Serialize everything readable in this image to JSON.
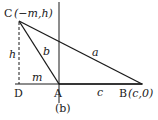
{
  "diagram": {
    "caption": "(b)",
    "points": {
      "C": {
        "label": "C",
        "coords": "(−m,h)",
        "x": 19,
        "y": 21
      },
      "D": {
        "label": "D",
        "x": 19,
        "y": 84
      },
      "A": {
        "label": "A",
        "x": 59,
        "y": 84
      },
      "B": {
        "label": "B",
        "coords": "(c,0)",
        "x": 142,
        "y": 84
      }
    },
    "segments": {
      "a": "a",
      "b": "b",
      "c": "c",
      "h": "h",
      "m": "m"
    },
    "colors": {
      "stroke": "#1a1a1a",
      "background": "#ffffff"
    }
  }
}
